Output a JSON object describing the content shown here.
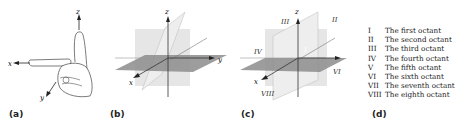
{
  "panels": {
    "a": {
      "label": "(a)",
      "title": "Right-hand rule",
      "axes": {
        "x": "x",
        "y": "y",
        "z": "z"
      }
    },
    "b": {
      "label": "(b)",
      "axes": {
        "x": "x",
        "y": "y",
        "z": "z"
      }
    },
    "c": {
      "label": "(c)",
      "axes": {
        "x": "x",
        "y": "y",
        "z": "z"
      },
      "octant_marks": {
        "I": "I",
        "II": "II",
        "III": "III",
        "IV": "IV",
        "VI": "VI",
        "VIII": "VIII"
      }
    },
    "d": {
      "label": "(d)",
      "legend": [
        {
          "num": "I",
          "text": "The first octant"
        },
        {
          "num": "II",
          "text": "The second octant"
        },
        {
          "num": "III",
          "text": "The third octant"
        },
        {
          "num": "IV",
          "text": "The fourth octant"
        },
        {
          "num": "V",
          "text": "The fifth octant"
        },
        {
          "num": "VI",
          "text": "The sixth octant"
        },
        {
          "num": "VII",
          "text": "The seventh octant"
        },
        {
          "num": "VIII",
          "text": "The eighth octant"
        }
      ]
    }
  }
}
